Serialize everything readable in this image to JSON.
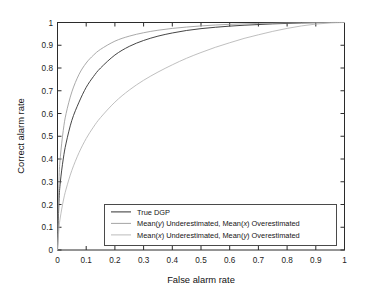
{
  "chart_data": {
    "type": "line",
    "title": "",
    "xlabel": "False alarm rate",
    "ylabel": "Correct alarm rate",
    "xlim": [
      0,
      1
    ],
    "ylim": [
      0,
      1
    ],
    "grid": false,
    "legend_position": "bottom-center-inside",
    "xticks": [
      "0",
      "0.1",
      "0.2",
      "0.3",
      "0.4",
      "0.5",
      "0.6",
      "0.7",
      "0.8",
      "0.9",
      "1"
    ],
    "xtick_values": [
      0,
      0.1,
      0.2,
      0.3,
      0.4,
      0.5,
      0.6,
      0.7,
      0.8,
      0.9,
      1
    ],
    "yticks": [
      "0",
      "0.1",
      "0.2",
      "0.3",
      "0.4",
      "0.5",
      "0.6",
      "0.7",
      "0.8",
      "0.9",
      "1"
    ],
    "ytick_values": [
      0,
      0.1,
      0.2,
      0.3,
      0.4,
      0.5,
      0.6,
      0.7,
      0.8,
      0.9,
      1
    ],
    "x": [
      0,
      0.005,
      0.01,
      0.02,
      0.03,
      0.05,
      0.075,
      0.1,
      0.125,
      0.15,
      0.2,
      0.25,
      0.3,
      0.35,
      0.4,
      0.45,
      0.5,
      0.55,
      0.6,
      0.65,
      0.7,
      0.75,
      0.8,
      0.85,
      0.9,
      0.95,
      1
    ],
    "series": [
      {
        "name": "True DGP",
        "color": "#3b3b3b",
        "values": [
          0,
          0.21,
          0.3,
          0.4,
          0.47,
          0.57,
          0.65,
          0.715,
          0.762,
          0.8,
          0.857,
          0.895,
          0.921,
          0.94,
          0.954,
          0.965,
          0.973,
          0.979,
          0.984,
          0.988,
          0.991,
          0.994,
          0.996,
          0.998,
          0.999,
          1.0,
          1.0
        ]
      },
      {
        "name": "Mean(y) Underestimated, Mean(x) Overestimated",
        "color": "#9a9a9a",
        "values": [
          0,
          0.3,
          0.41,
          0.525,
          0.6,
          0.695,
          0.772,
          0.822,
          0.856,
          0.882,
          0.918,
          0.94,
          0.955,
          0.966,
          0.974,
          0.98,
          0.985,
          0.989,
          0.992,
          0.994,
          0.996,
          0.997,
          0.9985,
          0.999,
          1.0,
          1.0,
          1.0
        ]
      },
      {
        "name": "Mean(x) Underestimated, Mean(y) Overestimated",
        "color": "#b4b4b4",
        "values": [
          0,
          0.095,
          0.145,
          0.215,
          0.268,
          0.35,
          0.428,
          0.49,
          0.54,
          0.582,
          0.65,
          0.703,
          0.746,
          0.782,
          0.814,
          0.843,
          0.868,
          0.891,
          0.911,
          0.93,
          0.946,
          0.961,
          0.974,
          0.985,
          0.993,
          0.998,
          1.0
        ]
      }
    ]
  },
  "legend": {
    "entries": [
      {
        "label_full": "True DGP",
        "prefix": "True DGP",
        "ital1": "",
        "mid": "",
        "ital2": "",
        "suffix": ""
      },
      {
        "label_full": "Mean(y) Underestimated, Mean(x) Overestimated",
        "prefix": "Mean(",
        "ital1": "y",
        "mid": ") Underestimated, Mean(",
        "ital2": "x",
        "suffix": ") Overestimated"
      },
      {
        "label_full": "Mean(x) Underestimated, Mean(y) Overestimated",
        "prefix": "Mean(",
        "ital1": "x",
        "mid": ") Underestimated, Mean(",
        "ital2": "y",
        "suffix": ") Overestimated"
      }
    ]
  },
  "axes": {
    "xlabel": "False alarm rate",
    "ylabel": "Correct alarm rate"
  },
  "colors": {
    "axis": "#2b2b2b",
    "background": "#ffffff",
    "series_1": "#3b3b3b",
    "series_2": "#9a9a9a",
    "series_3": "#b4b4b4",
    "legend_border": "#4a4a4a"
  }
}
